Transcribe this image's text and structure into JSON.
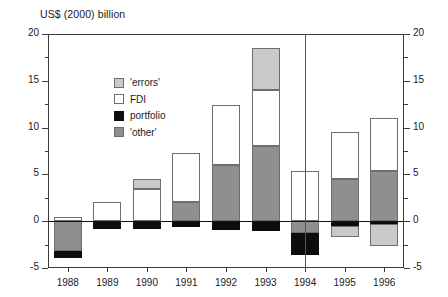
{
  "chart_data": {
    "type": "bar",
    "title": "US$ (2000) billion",
    "subtitle": "",
    "xlabel": "",
    "ylabel": "US$ (2000) billion",
    "ylim": [
      -5,
      20
    ],
    "ytick_major": [
      -5,
      0,
      5,
      10,
      15,
      20
    ],
    "ytick_minor": [
      -2.5,
      2.5,
      7.5,
      12.5,
      17.5
    ],
    "ytick_labels": [
      "-5",
      "0",
      "5",
      "10",
      "15",
      "20"
    ],
    "grid": false,
    "dual_axis": true,
    "legend_position": "top-left-inside",
    "stacked": true,
    "categories": [
      "1988",
      "1989",
      "1990",
      "1991",
      "1992",
      "1993",
      "1994",
      "1995",
      "1996"
    ],
    "annotations": [
      {
        "type": "vertical-line",
        "at": "1994",
        "label": ""
      }
    ],
    "series": [
      {
        "name": "'other'",
        "key": "other",
        "color": "#8f8f8f",
        "values": [
          -3.2,
          0.0,
          0.0,
          2.0,
          6.0,
          8.0,
          -1.3,
          4.5,
          5.4
        ]
      },
      {
        "name": "portfolio",
        "key": "portfolio",
        "color": "#0d0d0d",
        "values": [
          -0.7,
          -0.8,
          -0.8,
          -0.6,
          -0.9,
          -1.0,
          -2.3,
          -0.5,
          -0.3
        ]
      },
      {
        "name": "FDI",
        "key": "fdi",
        "color": "#ffffff",
        "values": [
          0.5,
          2.0,
          3.4,
          5.3,
          6.4,
          6.0,
          5.4,
          5.0,
          5.6
        ]
      },
      {
        "name": "'errors'",
        "key": "errors",
        "color": "#c9c9c9",
        "values": [
          0.0,
          0.0,
          1.1,
          0.0,
          0.0,
          4.5,
          0.0,
          -1.2,
          -2.3
        ]
      }
    ],
    "totals": [
      -3.4,
      1.2,
      3.7,
      6.7,
      11.5,
      17.5,
      1.8,
      7.8,
      8.4
    ],
    "bars": [
      {
        "category": "1988",
        "segments": [
          {
            "key": "other",
            "label": "'other'",
            "from": -3.2,
            "to": 0.0
          },
          {
            "key": "portfolio",
            "label": "portfolio",
            "from": -3.9,
            "to": -3.2
          },
          {
            "key": "fdi",
            "label": "FDI",
            "from": 0.0,
            "to": 0.5
          }
        ]
      },
      {
        "category": "1989",
        "segments": [
          {
            "key": "portfolio",
            "label": "portfolio",
            "from": -0.8,
            "to": 0.0
          },
          {
            "key": "fdi",
            "label": "FDI",
            "from": 0.0,
            "to": 2.0
          }
        ]
      },
      {
        "category": "1990",
        "segments": [
          {
            "key": "portfolio",
            "label": "portfolio",
            "from": -0.8,
            "to": 0.0
          },
          {
            "key": "fdi",
            "label": "FDI",
            "from": 0.0,
            "to": 3.4
          },
          {
            "key": "errors",
            "label": "'errors'",
            "from": 3.4,
            "to": 4.5
          }
        ]
      },
      {
        "category": "1991",
        "segments": [
          {
            "key": "portfolio",
            "label": "portfolio",
            "from": -0.6,
            "to": 0.0
          },
          {
            "key": "other",
            "label": "'other'",
            "from": 0.0,
            "to": 2.0
          },
          {
            "key": "fdi",
            "label": "FDI",
            "from": 2.0,
            "to": 7.3
          }
        ]
      },
      {
        "category": "1992",
        "segments": [
          {
            "key": "portfolio",
            "label": "portfolio",
            "from": -0.9,
            "to": 0.0
          },
          {
            "key": "other",
            "label": "'other'",
            "from": 0.0,
            "to": 6.0
          },
          {
            "key": "fdi",
            "label": "FDI",
            "from": 6.0,
            "to": 12.4
          }
        ]
      },
      {
        "category": "1993",
        "segments": [
          {
            "key": "portfolio",
            "label": "portfolio",
            "from": -1.0,
            "to": 0.0
          },
          {
            "key": "other",
            "label": "'other'",
            "from": 0.0,
            "to": 8.0
          },
          {
            "key": "fdi",
            "label": "FDI",
            "from": 8.0,
            "to": 14.0
          },
          {
            "key": "errors",
            "label": "'errors'",
            "from": 14.0,
            "to": 18.5
          }
        ]
      },
      {
        "category": "1994",
        "segments": [
          {
            "key": "portfolio",
            "label": "portfolio",
            "from": -3.6,
            "to": -1.3
          },
          {
            "key": "other",
            "label": "'other'",
            "from": -1.3,
            "to": 0.0
          },
          {
            "key": "fdi",
            "label": "FDI",
            "from": 0.0,
            "to": 5.4
          }
        ]
      },
      {
        "category": "1995",
        "segments": [
          {
            "key": "errors",
            "label": "'errors'",
            "from": -1.7,
            "to": -0.5
          },
          {
            "key": "portfolio",
            "label": "portfolio",
            "from": -0.5,
            "to": 0.0
          },
          {
            "key": "other",
            "label": "'other'",
            "from": 0.0,
            "to": 4.5
          },
          {
            "key": "fdi",
            "label": "FDI",
            "from": 4.5,
            "to": 9.5
          }
        ]
      },
      {
        "category": "1996",
        "segments": [
          {
            "key": "errors",
            "label": "'errors'",
            "from": -2.6,
            "to": -0.3
          },
          {
            "key": "portfolio",
            "label": "portfolio",
            "from": -0.3,
            "to": 0.0
          },
          {
            "key": "other",
            "label": "'other'",
            "from": 0.0,
            "to": 5.4
          },
          {
            "key": "fdi",
            "label": "FDI",
            "from": 5.4,
            "to": 11.0
          }
        ]
      }
    ],
    "legend": [
      {
        "key": "errors",
        "label": "'errors'",
        "color": "#c9c9c9"
      },
      {
        "key": "fdi",
        "label": "FDI",
        "color": "#ffffff"
      },
      {
        "key": "portfolio",
        "label": "portfolio",
        "color": "#0d0d0d"
      },
      {
        "key": "other",
        "label": "'other'",
        "color": "#8f8f8f"
      }
    ]
  }
}
